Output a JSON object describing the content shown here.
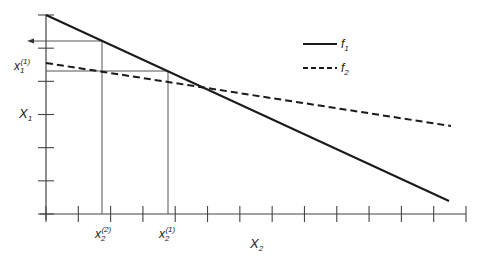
{
  "diagram": {
    "type": "line-intersection",
    "legend": [
      {
        "label": "f",
        "sub": "1",
        "style": "solid"
      },
      {
        "label": "f",
        "sub": "2",
        "style": "dashed"
      }
    ],
    "axes": {
      "x": {
        "label": "X",
        "sub": "2",
        "ticks": 13
      },
      "y": {
        "label": "X",
        "sub": "1",
        "ticks": 6
      }
    },
    "annotations": {
      "y_marker": {
        "label": "x",
        "sub": "1",
        "sup": "(1)"
      },
      "x_marker_2": {
        "label": "x",
        "sub": "2",
        "sup": "(2)"
      },
      "x_marker_1": {
        "label": "x",
        "sub": "2",
        "sup": "(1)"
      }
    },
    "colors": {
      "line": "#1a1a1a",
      "axis": "#444444",
      "guide": "#555555"
    }
  }
}
